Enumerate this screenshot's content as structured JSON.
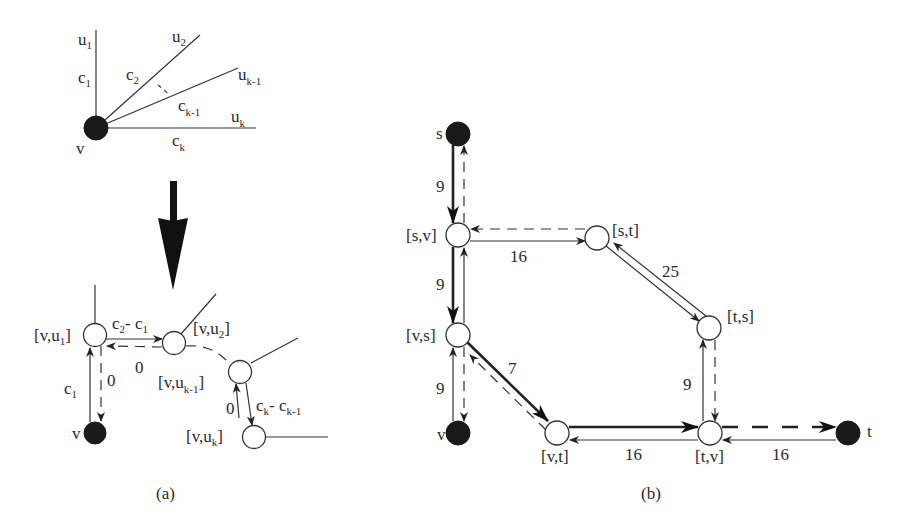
{
  "figure": {
    "panel_a": {
      "caption": "(a)",
      "top": {
        "center_node": "v",
        "neighbors": [
          "u1",
          "u2",
          "uk-1",
          "uk"
        ],
        "edge_costs": [
          "c1",
          "c2",
          "ck-1",
          "ck"
        ],
        "labels": {
          "v": "v",
          "u1": {
            "base": "u",
            "sub": "1"
          },
          "u2": {
            "base": "u",
            "sub": "2"
          },
          "uk1": {
            "base": "u",
            "sub": "k-1"
          },
          "uk": {
            "base": "u",
            "sub": "k"
          },
          "c1": {
            "base": "c",
            "sub": "1"
          },
          "c2": {
            "base": "c",
            "sub": "2"
          },
          "ck1": {
            "base": "c",
            "sub": "k-1"
          },
          "ck": {
            "base": "c",
            "sub": "k"
          }
        }
      },
      "transform_arrow": "down-arrow",
      "bottom": {
        "nodes": {
          "vu1": {
            "pre": "[v,u",
            "sub": "1",
            "post": "]"
          },
          "vu2": {
            "pre": "[v,u",
            "sub": "2",
            "post": "]"
          },
          "vuk1": {
            "pre": "[v,u",
            "sub": "k-1",
            "post": "]"
          },
          "vuk": {
            "pre": "[v,u",
            "sub": "k",
            "post": "]"
          },
          "v": "v"
        },
        "edges": {
          "v_to_vu1": {
            "base": "c",
            "sub": "1"
          },
          "vu1_to_v": "0",
          "vu1_to_vu2": {
            "a": "c",
            "asub": "2",
            "sep": "- ",
            "b": "c",
            "bsub": "1"
          },
          "vu2_to_vu1": "0",
          "vuk1_to_vuk": {
            "a": "c",
            "asub": "k",
            "sep": "- ",
            "b": "c",
            "bsub": "k-1"
          },
          "vuk_to_vuk1": "0"
        }
      }
    },
    "panel_b": {
      "caption": "(b)",
      "nodes": {
        "s": "s",
        "sv": "[s,v]",
        "st": "[s,t]",
        "ts": "[t,s]",
        "vs": "[v,s]",
        "v": "v",
        "vt": "[v,t]",
        "tv": "[t,v]",
        "t": "t"
      },
      "edge_weights": {
        "s_sv": "9",
        "sv_vs": "9",
        "v_vs": "9",
        "sv_st": "16",
        "st_ts": "25",
        "vs_vt": "7",
        "tv_ts": "9",
        "tv_vt": "16",
        "t_tv": "16"
      }
    }
  }
}
